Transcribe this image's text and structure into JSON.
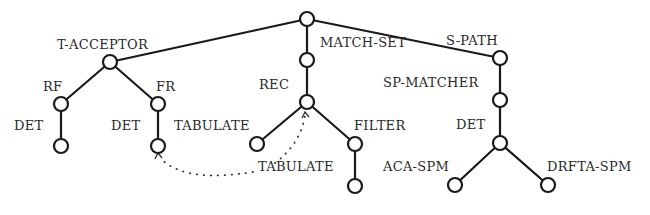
{
  "diagram": {
    "title": "",
    "colors": {
      "stroke": "#1a1a1a",
      "node_fill": "#ffffff",
      "text": "#2a2a2a",
      "background": "#ffffff"
    },
    "nodes": [
      {
        "id": "root",
        "x": 307,
        "y": 19,
        "label": ""
      },
      {
        "id": "t-acceptor",
        "x": 110,
        "y": 62,
        "label": "T-ACCEPTOR",
        "lx": 57,
        "ly": 49
      },
      {
        "id": "rf",
        "x": 61,
        "y": 104,
        "label": "RF",
        "lx": 43,
        "ly": 91
      },
      {
        "id": "rf-det",
        "x": 61,
        "y": 146,
        "label": "DET",
        "lx": 14,
        "ly": 130
      },
      {
        "id": "fr",
        "x": 158,
        "y": 104,
        "label": "FR",
        "lx": 156,
        "ly": 91
      },
      {
        "id": "fr-det",
        "x": 158,
        "y": 146,
        "label": "DET",
        "lx": 111,
        "ly": 130
      },
      {
        "id": "match-set",
        "x": 307,
        "y": 60,
        "label": "MATCH-SET",
        "lx": 320,
        "ly": 47
      },
      {
        "id": "rec",
        "x": 307,
        "y": 102,
        "label": "REC",
        "lx": 259,
        "ly": 89
      },
      {
        "id": "tabulate-left",
        "x": 257,
        "y": 144,
        "label": "TABULATE",
        "lx": 174,
        "ly": 130
      },
      {
        "id": "filter",
        "x": 355,
        "y": 144,
        "label": "FILTER",
        "lx": 354,
        "ly": 130
      },
      {
        "id": "filter-child",
        "x": 355,
        "y": 186,
        "label": "TABULATE",
        "lx": 258,
        "ly": 171
      },
      {
        "id": "s-path",
        "x": 500,
        "y": 58,
        "label": "S-PATH",
        "lx": 446,
        "ly": 45
      },
      {
        "id": "sp-matcher",
        "x": 500,
        "y": 100,
        "label": "SP-MATCHER",
        "lx": 383,
        "ly": 87
      },
      {
        "id": "det",
        "x": 500,
        "y": 143,
        "label": "DET",
        "lx": 456,
        "ly": 129
      },
      {
        "id": "aca-spm",
        "x": 455,
        "y": 185,
        "label": "ACA-SPM",
        "lx": 383,
        "ly": 171
      },
      {
        "id": "drfta-spm",
        "x": 548,
        "y": 185,
        "label": "DRFTA-SPM",
        "lx": 547,
        "ly": 171
      }
    ],
    "edges": [
      [
        "root",
        "t-acceptor"
      ],
      [
        "root",
        "match-set"
      ],
      [
        "root",
        "s-path"
      ],
      [
        "t-acceptor",
        "rf"
      ],
      [
        "t-acceptor",
        "fr"
      ],
      [
        "rf",
        "rf-det"
      ],
      [
        "fr",
        "fr-det"
      ],
      [
        "match-set",
        "rec"
      ],
      [
        "rec",
        "tabulate-left"
      ],
      [
        "rec",
        "filter"
      ],
      [
        "filter",
        "filter-child"
      ],
      [
        "s-path",
        "sp-matcher"
      ],
      [
        "sp-matcher",
        "det"
      ],
      [
        "det",
        "aca-spm"
      ],
      [
        "det",
        "drfta-spm"
      ]
    ],
    "dotted_link": {
      "description": "dotted arrows from TABULATE label to FR-DET leaf and to REC node",
      "from_label": "TABULATE",
      "targets": [
        "fr-det",
        "rec"
      ]
    }
  }
}
